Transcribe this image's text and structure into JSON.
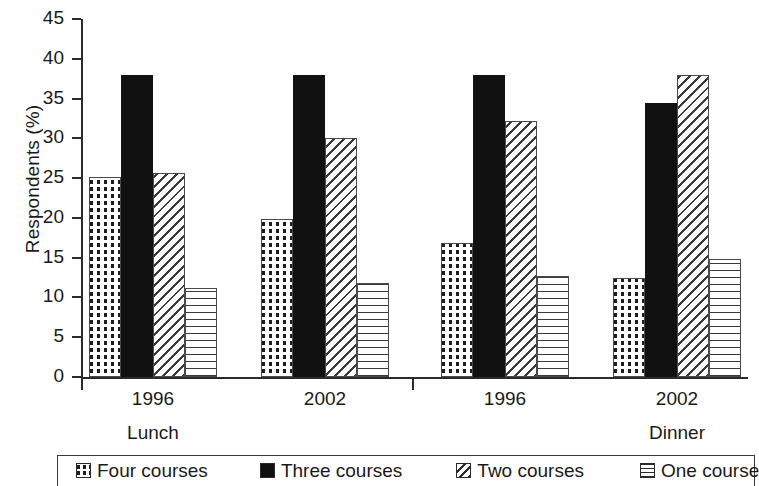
{
  "chart_data": {
    "type": "bar",
    "title": "",
    "subtitle": "",
    "xlabel": "",
    "ylabel": "Respondents (%)",
    "ylim": [
      0,
      45
    ],
    "ytick_labels": [
      "0",
      "5",
      "10",
      "15",
      "20",
      "25",
      "30",
      "35",
      "40",
      "45"
    ],
    "ytick_values": [
      0,
      5,
      10,
      15,
      20,
      25,
      30,
      35,
      40,
      45
    ],
    "grid": false,
    "legend_position": "bottom",
    "categories": [
      "1996",
      "2002",
      "1996",
      "2002"
    ],
    "group_sections": [
      "Lunch",
      "Dinner"
    ],
    "series": [
      {
        "name": "Four courses",
        "pattern": "dots",
        "values": [
          25.2,
          19.9,
          16.9,
          12.4
        ]
      },
      {
        "name": "Three courses",
        "pattern": "solid",
        "values": [
          38.0,
          38.0,
          38.0,
          34.4
        ]
      },
      {
        "name": "Two courses",
        "pattern": "diag",
        "values": [
          25.6,
          30.1,
          32.2,
          38.0
        ]
      },
      {
        "name": "One course",
        "pattern": "horiz",
        "values": [
          11.2,
          11.8,
          12.7,
          14.8
        ]
      }
    ]
  },
  "axis": {
    "y_title": "Respondents (%)",
    "ticks": [
      "45",
      "40",
      "35",
      "30",
      "25",
      "20",
      "15",
      "10",
      "5",
      "0"
    ]
  },
  "x_axis": {
    "groups": [
      {
        "year": "1996",
        "section": "Lunch"
      },
      {
        "year": "2002",
        "section": ""
      },
      {
        "year": "1996",
        "section": ""
      },
      {
        "year": "2002",
        "section": "Dinner"
      }
    ]
  },
  "legend": {
    "items": [
      {
        "label": "Four courses",
        "pattern": "dots"
      },
      {
        "label": "Three courses",
        "pattern": "solid"
      },
      {
        "label": "Two courses",
        "pattern": "diag"
      },
      {
        "label": "One course",
        "pattern": "horiz"
      }
    ]
  },
  "colors": {
    "ink": "#1a1a1a",
    "axis": "#2b2b2b",
    "bar_outline": "#4a4a4a",
    "solid_fill": "#111111",
    "background": "#ffffff"
  }
}
